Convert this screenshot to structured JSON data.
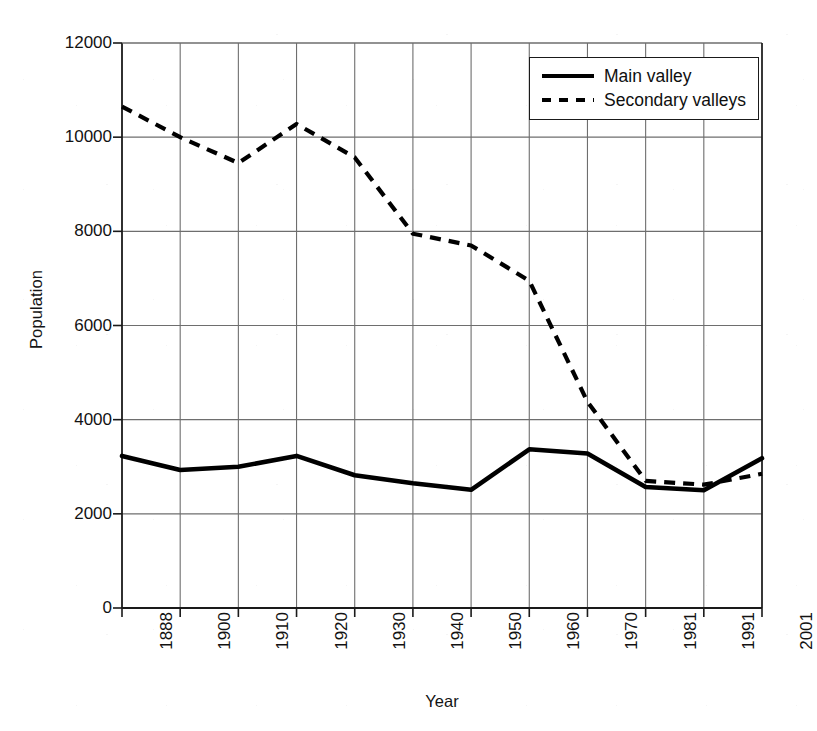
{
  "chart_data": {
    "type": "line",
    "title": "",
    "xlabel": "Year",
    "ylabel": "Population",
    "categories": [
      "1888",
      "1900",
      "1910",
      "1920",
      "1930",
      "1940",
      "1950",
      "1960",
      "1970",
      "1981",
      "1991",
      "2001"
    ],
    "series": [
      {
        "name": "Main valley",
        "style": "solid",
        "color": "#000000",
        "values": [
          3230,
          2930,
          3000,
          3230,
          2820,
          2650,
          2510,
          3370,
          3280,
          2570,
          2500,
          3180
        ]
      },
      {
        "name": "Secondary valleys",
        "style": "dashed",
        "color": "#000000",
        "values": [
          10650,
          10000,
          9450,
          10280,
          9570,
          7950,
          7700,
          6950,
          4380,
          2700,
          2620,
          2850
        ]
      }
    ],
    "ylim": [
      0,
      12000
    ],
    "yticks": [
      "0",
      "2000",
      "4000",
      "6000",
      "8000",
      "10000",
      "12000"
    ],
    "ytick_values": [
      0,
      2000,
      4000,
      6000,
      8000,
      10000,
      12000
    ],
    "grid": "both",
    "legend_position": "top-right"
  },
  "legend": {
    "entries": [
      {
        "label": "Main valley",
        "style": "solid"
      },
      {
        "label": "Secondary valleys",
        "style": "dashed"
      }
    ]
  },
  "axes": {
    "x_title": "Year",
    "y_title": "Population"
  },
  "colors": {
    "line": "#000000",
    "grid": "#6e6e6e",
    "axis": "#1a1a1a",
    "background": "#ffffff"
  }
}
